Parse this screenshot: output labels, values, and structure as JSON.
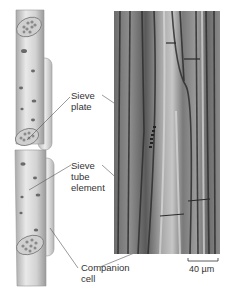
{
  "figure": {
    "diagram_labels": [
      {
        "id": "sieve-plate",
        "lines": [
          "Sieve",
          "plate"
        ]
      },
      {
        "id": "sieve-tube-element",
        "lines": [
          "Sieve",
          "tube",
          "element"
        ]
      },
      {
        "id": "companion-cell",
        "lines": [
          "Companion",
          "cell"
        ]
      }
    ],
    "scale_bar": {
      "label": "40 µm"
    },
    "colors": {
      "cell_body": "#dcdcdc",
      "cell_shadow": "#a8a8a8",
      "micrograph_dark": "#3a3a3a",
      "micrograph_light": "#c8c8c8",
      "leader_line": "#555555",
      "text": "#333333"
    }
  }
}
